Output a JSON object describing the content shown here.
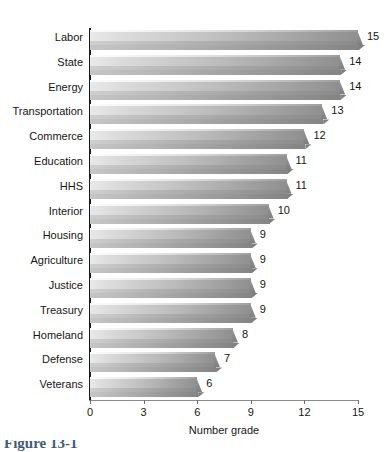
{
  "chart_data": {
    "type": "bar",
    "orientation": "horizontal",
    "title": "",
    "subtitle": "",
    "xlabel": "Number grade",
    "ylabel": "",
    "xlim": [
      0,
      15
    ],
    "xticks": [
      0,
      3,
      6,
      9,
      12,
      15
    ],
    "xtick_labels": [
      "0",
      "3",
      "6",
      "9",
      "12",
      "15"
    ],
    "grid": false,
    "legend": null,
    "show_value_labels": true,
    "categories": [
      "Labor",
      "State",
      "Energy",
      "Transportation",
      "Commerce",
      "Education",
      "HHS",
      "Interior",
      "Housing",
      "Agriculture",
      "Justice",
      "Treasury",
      "Homeland",
      "Defense",
      "Veterans"
    ],
    "values": [
      15,
      14,
      14,
      13,
      12,
      11,
      11,
      10,
      9,
      9,
      9,
      9,
      8,
      7,
      6
    ],
    "value_labels": [
      "15",
      "14",
      "14",
      "13",
      "12",
      "11",
      "11",
      "10",
      "9",
      "9",
      "9",
      "9",
      "8",
      "7",
      "6"
    ],
    "series": [
      {
        "name": "Number grade",
        "values": [
          15,
          14,
          14,
          13,
          12,
          11,
          11,
          10,
          9,
          9,
          9,
          9,
          8,
          7,
          6
        ]
      }
    ],
    "style": {
      "bar_fill_light": "#e9e9e9",
      "bar_fill_dark": "#8f8f8f",
      "bar_shadow": "#9d9d9d",
      "axis_color": "#1b1b1b",
      "text_color": "#161616",
      "background": "#ffffff",
      "three_d": true
    }
  },
  "figure": {
    "caption_fragment": "Figure 13-1",
    "caption_color": "#3f5b78"
  }
}
